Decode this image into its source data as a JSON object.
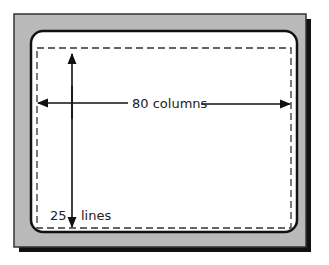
{
  "diagram": {
    "labels": {
      "columns": "80 columns",
      "lines_number": "25",
      "lines_word": "lines"
    },
    "colors": {
      "frame_fill": "#b9b9b9",
      "frame_shadow": "#111111",
      "screen_fill": "#ffffff",
      "screen_border": "#111111",
      "dashed_area": "#333333",
      "arrow": "#111111",
      "text": "#222222"
    }
  }
}
